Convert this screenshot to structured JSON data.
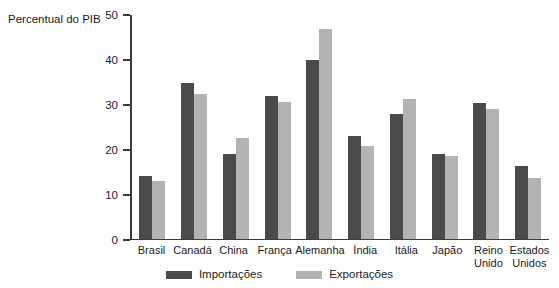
{
  "chart_data": {
    "type": "bar",
    "title": "Percentual do PIB",
    "xlabel": "",
    "ylabel": "Percentual do PIB",
    "ylim": [
      0,
      50
    ],
    "yticks": [
      0,
      10,
      20,
      30,
      40,
      50
    ],
    "grid": false,
    "legend_position": "bottom",
    "categories": [
      "Brasil",
      "Canadá",
      "China",
      "França",
      "Alemanha",
      "Índia",
      "Itália",
      "Japão",
      "Reino\nUnido",
      "Estados\nUnidos"
    ],
    "series": [
      {
        "name": "Importações",
        "color": "#4a4a4a",
        "values": [
          14,
          34.8,
          19,
          32,
          40,
          23,
          28,
          19,
          30.4,
          16.3
        ]
      },
      {
        "name": "Exportações",
        "color": "#b3b3b3",
        "values": [
          13,
          32.3,
          22.5,
          30.7,
          47,
          20.7,
          31.2,
          18.6,
          29,
          13.5
        ]
      }
    ]
  }
}
